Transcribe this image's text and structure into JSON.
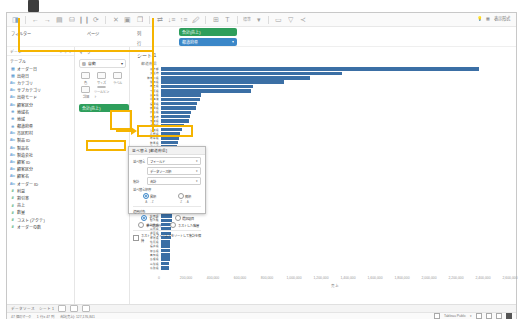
{
  "app": {
    "title": "Tableau Desktop"
  },
  "toolbar": {
    "left_icons": [
      "tableau-logo-icon",
      "undo-icon",
      "redo-icon",
      "save-icon",
      "new-data-source-icon",
      "pause-icon",
      "refresh-icon",
      "clear-sheet-icon",
      "new-worksheet-icon",
      "duplicate-icon",
      "swap-rows-cols-icon",
      "sort-asc-icon",
      "sort-desc-icon",
      "highlight-icon",
      "group-icon",
      "show-labels-icon",
      "fit-icon",
      "fix-axes-icon",
      "format-icon",
      "presentation-icon",
      "share-icon"
    ],
    "fit_label": "標準",
    "right": {
      "help_label": "表示形式",
      "show_me_icon": "show-me-icon",
      "lightbulb_icon": "lightbulb-icon"
    }
  },
  "shelves": {
    "filters_label": "フィルター",
    "pages_label": "ページ",
    "columns_label": "列",
    "rows_label": "行",
    "columns_pill": {
      "label": "合計(売上)",
      "color": "#2e9e5b"
    },
    "rows_pill": {
      "label": "都道府県",
      "color": "#3b87c8",
      "caret": "▾"
    }
  },
  "data_pane": {
    "header": "データ",
    "search_icon": "search-icon",
    "sort_icon": "sort-icon",
    "menu_icon": "menu-icon",
    "section_label": "テーブル",
    "fields": [
      {
        "icon": "calendar-icon",
        "label": "オーダー日"
      },
      {
        "icon": "calendar-icon",
        "label": "出荷日"
      },
      {
        "icon": "text-icon",
        "label": "カテゴリ"
      },
      {
        "icon": "text-icon",
        "label": "サブカテゴリ"
      },
      {
        "icon": "text-icon",
        "label": "出荷モード"
      },
      {
        "icon": "text-icon",
        "label": "顧客区分"
      },
      {
        "icon": "globe-icon",
        "label": "地域名"
      },
      {
        "icon": "globe-icon",
        "label": "地域"
      },
      {
        "icon": "globe-icon",
        "label": "都道府県"
      },
      {
        "icon": "text-icon",
        "label": "市区町村"
      },
      {
        "icon": "text-icon",
        "label": "製品 ID"
      },
      {
        "icon": "text-icon",
        "label": "製品名"
      },
      {
        "icon": "text-icon",
        "label": "製造会社"
      },
      {
        "icon": "text-icon",
        "label": "顧客 ID"
      },
      {
        "icon": "text-icon",
        "label": "顧客区分"
      },
      {
        "icon": "text-icon",
        "label": "顧客名"
      },
      {
        "icon": "text-icon",
        "label": "オーダー ID"
      },
      {
        "icon": "hash-icon",
        "label": "利益"
      },
      {
        "icon": "hash-icon",
        "label": "割引率"
      },
      {
        "icon": "hash-icon",
        "label": "売上"
      },
      {
        "icon": "hash-icon",
        "label": "数量"
      },
      {
        "icon": "hash-icon",
        "label": "コスト (アクテ)"
      },
      {
        "icon": "hash-icon",
        "label": "オーダーの数"
      }
    ]
  },
  "marks_card": {
    "title": "マーク",
    "type_label": "自動",
    "type_caret": "▾",
    "buttons": [
      {
        "icon": "color-icon",
        "label": "色"
      },
      {
        "icon": "size-icon",
        "label": "サイズ"
      },
      {
        "icon": "label-icon",
        "label": "ラベル"
      },
      {
        "icon": "detail-icon",
        "label": "詳細"
      },
      {
        "icon": "tooltip-icon",
        "label": "ツールヒント"
      }
    ],
    "pill": {
      "label": "合計(売上)",
      "color": "#2e9e5b"
    }
  },
  "viz": {
    "sheet_title": "シート 1",
    "column_header": "都道府県"
  },
  "sort_dialog": {
    "title": "並べ替え [都道府県]",
    "sort_by_label": "並べ替え",
    "sort_by_value": "フィールド",
    "field_row_label": "",
    "field_value": "データソース順",
    "aggregation_label": "集計",
    "aggregation_value": "合計",
    "order_label": "並べ替え順序",
    "order_options": [
      {
        "label": "昇順",
        "selected": true,
        "sub": "A → Z"
      },
      {
        "label": "降順",
        "selected": false,
        "sub": "Z → A"
      }
    ],
    "apply_scope_label": "適用対象",
    "scope_options": [
      {
        "label": "すべて",
        "selected": true
      },
      {
        "label": "選択項目",
        "selected": false
      },
      {
        "label": "単一選択行",
        "selected": false
      },
      {
        "label": "ネストした階層",
        "selected": false
      }
    ],
    "checkbox_label": "ネストしたフィールドをソートして集計を保持",
    "checkbox_checked": false
  },
  "annotations": {
    "box1_name": "marks-detail-highlight",
    "box2_name": "tooltip-button-highlight",
    "box3_name": "sort-entry-highlight",
    "arrow_name": "annotation-arrow",
    "color": "#f5b400"
  },
  "chart_data": {
    "type": "bar",
    "title": "シート 1",
    "xlabel": "売上",
    "ylabel": "都道府県",
    "orientation": "horizontal",
    "bar_color": "#3b6fa5",
    "grid": false,
    "xlim": [
      0,
      2800000
    ],
    "xticks": [
      "0",
      "200,000",
      "400,000",
      "600,000",
      "800,000",
      "1,000,000",
      "1,200,000",
      "1,400,000",
      "1,600,000",
      "1,800,000",
      "2,000,000",
      "2,200,000",
      "2,400,000",
      "2,600,000"
    ],
    "categories": [
      "東京都",
      "大阪府",
      "神奈川県",
      "愛知県",
      "埼玉県",
      "千葉県",
      "兵庫県",
      "北海道",
      "福岡県",
      "静岡県",
      "広島県",
      "京都府",
      "茨城県",
      "新潟県",
      "宮城県",
      "長野県",
      "岐阜県",
      "群馬県",
      "栃木県",
      "福島県",
      "岡山県",
      "三重県",
      "熊本県",
      "鹿児島県",
      "山口県",
      "愛媛県",
      "長崎県",
      "青森県",
      "岩手県",
      "沖縄県",
      "石川県",
      "大分県",
      "宮崎県",
      "富山県",
      "秋田県",
      "香川県",
      "和歌山県",
      "山形県",
      "滋賀県",
      "奈良県",
      "佐賀県",
      "福井県",
      "徳島県",
      "高知県",
      "島根県",
      "山梨県",
      "鳥取県"
    ],
    "values": [
      2620000,
      1490000,
      1230000,
      1010000,
      760000,
      740000,
      330000,
      320000,
      300000,
      290000,
      250000,
      240000,
      230000,
      190000,
      170000,
      160000,
      150000,
      140000,
      135000,
      130000,
      125000,
      120000,
      118000,
      115000,
      112000,
      110000,
      108000,
      105000,
      102000,
      100000,
      98000,
      96000,
      94000,
      92000,
      90000,
      88000,
      86000,
      84000,
      82000,
      80000,
      78000,
      76000,
      74000,
      72000,
      70000,
      68000,
      66000
    ]
  },
  "tab_bar": {
    "datasource_label": "データソース",
    "sheet_label": "シート 1",
    "icons": [
      "new-worksheet-icon",
      "new-dashboard-icon",
      "new-story-icon"
    ]
  },
  "status_bar": {
    "marks_label": "47 個のマーク",
    "rows_cols_label": "1 行 x 47 列",
    "sum_label": "合計(売上): 127,176,841",
    "product_label": "Tableau Public",
    "caret": "▾",
    "zoom_icons": [
      "layout-icon",
      "layout-icon",
      "layout-icon",
      "layout-icon"
    ]
  }
}
